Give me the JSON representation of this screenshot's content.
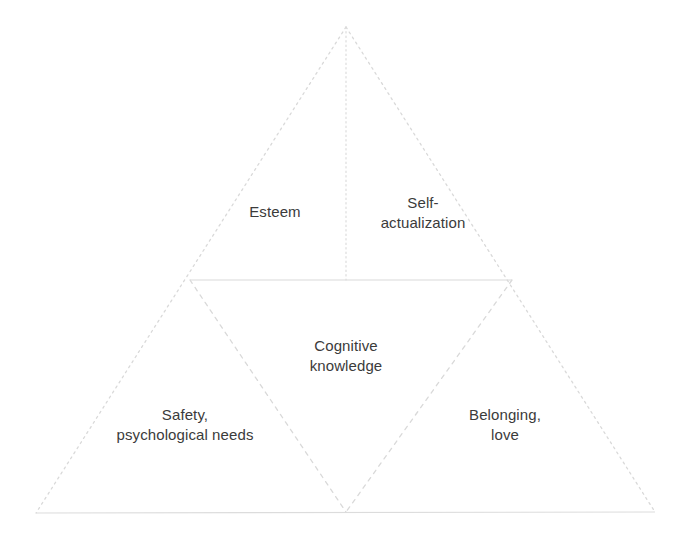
{
  "diagram": {
    "type": "pyramid-hierarchy",
    "title": "",
    "background_color": "#ffffff",
    "line_color": "#d9d9d9",
    "text_color": "#3b3b3b",
    "outline": {
      "apex": [
        346,
        27
      ],
      "base_left": [
        36,
        513
      ],
      "base_right": [
        655,
        512
      ],
      "style": "dotted"
    },
    "divider_lines": [
      {
        "name": "midline",
        "from": [
          190,
          280
        ],
        "to": [
          512,
          280
        ],
        "style": "solid"
      },
      {
        "name": "apex-vertical",
        "from": [
          346,
          27
        ],
        "to": [
          346,
          280
        ],
        "style": "dotted"
      },
      {
        "name": "inner-left",
        "from": [
          190,
          280
        ],
        "to": [
          346,
          512
        ],
        "style": "dashed"
      },
      {
        "name": "inner-right",
        "from": [
          512,
          280
        ],
        "to": [
          346,
          512
        ],
        "style": "dashed"
      }
    ],
    "sections": [
      {
        "id": "esteem",
        "label": "Esteem",
        "position": "upper-left"
      },
      {
        "id": "self-actualization",
        "label": "Self-\nactualization",
        "position": "upper-right"
      },
      {
        "id": "cognitive-knowledge",
        "label": "Cognitive\nknowledge",
        "position": "center"
      },
      {
        "id": "safety",
        "label": "Safety,\npsychological needs",
        "position": "lower-left"
      },
      {
        "id": "belonging",
        "label": "Belonging,\nlove",
        "position": "lower-right"
      }
    ]
  }
}
